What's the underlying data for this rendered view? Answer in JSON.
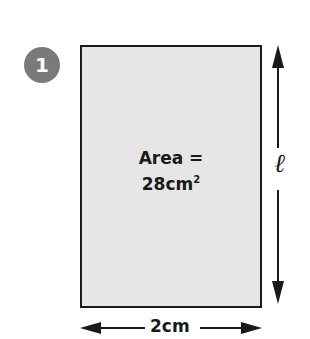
{
  "question": {
    "number": "1"
  },
  "shape": {
    "type": "rectangle",
    "area_line1": "Area =",
    "area_value": "28cm",
    "area_exponent": "2",
    "fill": "#e6e6e6",
    "border": "#1a1a1a"
  },
  "dimensions": {
    "height_label": "ℓ",
    "width_label": "2cm"
  },
  "colors": {
    "badge": "#7a7a7a",
    "line": "#1a1a1a"
  }
}
